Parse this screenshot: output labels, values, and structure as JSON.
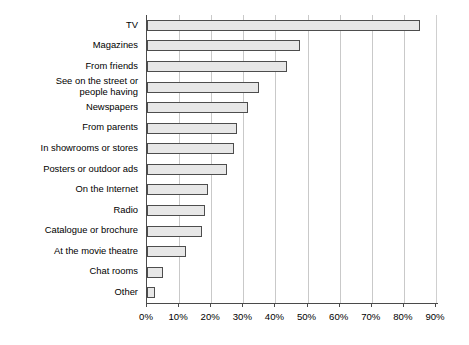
{
  "chart_data": {
    "type": "bar",
    "orientation": "horizontal",
    "title": "",
    "subtitle": "",
    "xlabel": "",
    "ylabel": "",
    "xlim": [
      0,
      90
    ],
    "grid": true,
    "legend": null,
    "tick_suffix": "%",
    "xticks": [
      0,
      10,
      20,
      30,
      40,
      50,
      60,
      70,
      80,
      90
    ],
    "xtick_labels": [
      "0%",
      "10%",
      "20%",
      "30%",
      "40%",
      "50%",
      "60%",
      "70%",
      "80%",
      "90%"
    ],
    "categories": [
      "TV",
      "Magazines",
      "From friends",
      "See on the street or\npeople having",
      "Newspapers",
      "From parents",
      "In showrooms or stores",
      "Posters or outdoor ads",
      "On the Internet",
      "Radio",
      "Catalogue or brochure",
      "At the movie theatre",
      "Chat rooms",
      "Other"
    ],
    "values": [
      85,
      47.5,
      43.5,
      35,
      31.5,
      28,
      27,
      25,
      19,
      18,
      17,
      12,
      5,
      2.5
    ],
    "bar_fill_color": "#e7e7e7",
    "bar_edge_color": "#4d4d4d",
    "gridline_color": "#c9c9c9",
    "axis_color": "#4a4a4a"
  }
}
